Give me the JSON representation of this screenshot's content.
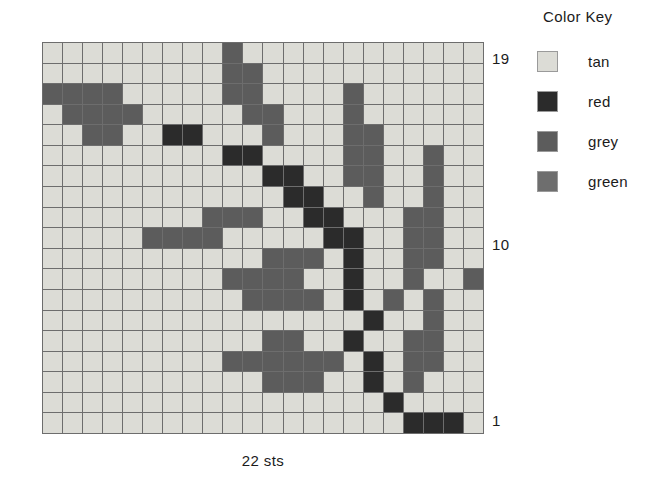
{
  "chart_data": {
    "type": "heatmap",
    "title": "",
    "xlabel": "22 sts",
    "ylabel": "",
    "columns": 22,
    "rows": 19,
    "grid_line_color": "#6d6d6d",
    "legend_position": "right",
    "palette": {
      "tan": "#dcdcd6",
      "red": "#2b2b2b",
      "grey": "#5c5c5c",
      "green": "#6e6e6e"
    },
    "row_labels": [
      "19",
      "10",
      "1"
    ],
    "note": "cells listed top row (19) first, left to right; values are color-key names",
    "cells": [
      [
        "tan",
        "tan",
        "tan",
        "tan",
        "tan",
        "tan",
        "tan",
        "tan",
        "tan",
        "grey",
        "tan",
        "tan",
        "tan",
        "tan",
        "tan",
        "tan",
        "tan",
        "tan",
        "tan",
        "tan",
        "tan",
        "tan"
      ],
      [
        "tan",
        "tan",
        "tan",
        "tan",
        "tan",
        "tan",
        "tan",
        "tan",
        "tan",
        "grey",
        "grey",
        "tan",
        "tan",
        "tan",
        "tan",
        "tan",
        "tan",
        "tan",
        "tan",
        "tan",
        "tan",
        "tan"
      ],
      [
        "grey",
        "grey",
        "grey",
        "grey",
        "tan",
        "tan",
        "tan",
        "tan",
        "tan",
        "grey",
        "grey",
        "tan",
        "tan",
        "tan",
        "tan",
        "grey",
        "tan",
        "tan",
        "tan",
        "tan",
        "tan",
        "tan"
      ],
      [
        "tan",
        "grey",
        "grey",
        "grey",
        "grey",
        "tan",
        "tan",
        "tan",
        "tan",
        "tan",
        "grey",
        "grey",
        "tan",
        "tan",
        "tan",
        "grey",
        "tan",
        "tan",
        "tan",
        "tan",
        "tan",
        "tan"
      ],
      [
        "tan",
        "tan",
        "grey",
        "grey",
        "tan",
        "tan",
        "red",
        "red",
        "tan",
        "tan",
        "tan",
        "grey",
        "tan",
        "tan",
        "tan",
        "grey",
        "grey",
        "tan",
        "tan",
        "tan",
        "tan",
        "tan"
      ],
      [
        "tan",
        "tan",
        "tan",
        "tan",
        "tan",
        "tan",
        "tan",
        "tan",
        "tan",
        "red",
        "red",
        "tan",
        "tan",
        "tan",
        "tan",
        "grey",
        "grey",
        "tan",
        "tan",
        "grey",
        "tan",
        "tan"
      ],
      [
        "tan",
        "tan",
        "tan",
        "tan",
        "tan",
        "tan",
        "tan",
        "tan",
        "tan",
        "tan",
        "tan",
        "red",
        "red",
        "tan",
        "tan",
        "grey",
        "grey",
        "tan",
        "tan",
        "grey",
        "tan",
        "tan"
      ],
      [
        "tan",
        "tan",
        "tan",
        "tan",
        "tan",
        "tan",
        "tan",
        "tan",
        "tan",
        "tan",
        "tan",
        "tan",
        "red",
        "red",
        "tan",
        "tan",
        "grey",
        "tan",
        "tan",
        "grey",
        "tan",
        "tan"
      ],
      [
        "tan",
        "tan",
        "tan",
        "tan",
        "tan",
        "tan",
        "tan",
        "tan",
        "grey",
        "grey",
        "grey",
        "tan",
        "tan",
        "red",
        "red",
        "tan",
        "tan",
        "tan",
        "grey",
        "grey",
        "tan",
        "tan"
      ],
      [
        "tan",
        "tan",
        "tan",
        "tan",
        "tan",
        "grey",
        "grey",
        "grey",
        "grey",
        "tan",
        "tan",
        "tan",
        "tan",
        "tan",
        "red",
        "red",
        "tan",
        "tan",
        "grey",
        "grey",
        "tan",
        "tan"
      ],
      [
        "tan",
        "tan",
        "tan",
        "tan",
        "tan",
        "tan",
        "tan",
        "tan",
        "tan",
        "tan",
        "tan",
        "grey",
        "grey",
        "grey",
        "tan",
        "red",
        "tan",
        "tan",
        "grey",
        "grey",
        "tan",
        "tan"
      ],
      [
        "tan",
        "tan",
        "tan",
        "tan",
        "tan",
        "tan",
        "tan",
        "tan",
        "tan",
        "grey",
        "grey",
        "grey",
        "grey",
        "tan",
        "tan",
        "red",
        "tan",
        "tan",
        "grey",
        "tan",
        "tan",
        "grey"
      ],
      [
        "tan",
        "tan",
        "tan",
        "tan",
        "tan",
        "tan",
        "tan",
        "tan",
        "tan",
        "tan",
        "grey",
        "grey",
        "grey",
        "grey",
        "tan",
        "red",
        "tan",
        "grey",
        "tan",
        "grey",
        "tan",
        "tan"
      ],
      [
        "tan",
        "tan",
        "tan",
        "tan",
        "tan",
        "tan",
        "tan",
        "tan",
        "tan",
        "tan",
        "tan",
        "tan",
        "tan",
        "tan",
        "tan",
        "tan",
        "red",
        "tan",
        "tan",
        "grey",
        "tan",
        "tan"
      ],
      [
        "tan",
        "tan",
        "tan",
        "tan",
        "tan",
        "tan",
        "tan",
        "tan",
        "tan",
        "tan",
        "tan",
        "grey",
        "grey",
        "tan",
        "tan",
        "red",
        "tan",
        "tan",
        "grey",
        "grey",
        "tan",
        "tan"
      ],
      [
        "tan",
        "tan",
        "tan",
        "tan",
        "tan",
        "tan",
        "tan",
        "tan",
        "tan",
        "grey",
        "grey",
        "grey",
        "grey",
        "grey",
        "grey",
        "tan",
        "red",
        "tan",
        "grey",
        "grey",
        "tan",
        "tan"
      ],
      [
        "tan",
        "tan",
        "tan",
        "tan",
        "tan",
        "tan",
        "tan",
        "tan",
        "tan",
        "tan",
        "tan",
        "grey",
        "grey",
        "grey",
        "tan",
        "tan",
        "red",
        "tan",
        "grey",
        "tan",
        "tan",
        "tan"
      ],
      [
        "tan",
        "tan",
        "tan",
        "tan",
        "tan",
        "tan",
        "tan",
        "tan",
        "tan",
        "tan",
        "tan",
        "tan",
        "tan",
        "tan",
        "tan",
        "tan",
        "tan",
        "red",
        "tan",
        "tan",
        "tan",
        "tan"
      ],
      [
        "tan",
        "tan",
        "tan",
        "tan",
        "tan",
        "tan",
        "tan",
        "tan",
        "tan",
        "tan",
        "tan",
        "tan",
        "tan",
        "tan",
        "tan",
        "tan",
        "tan",
        "tan",
        "red",
        "red",
        "red",
        "tan"
      ]
    ]
  },
  "row_labels": {
    "top": "19",
    "middle": "10",
    "bottom": "1"
  },
  "caption": {
    "sts": "22 sts"
  },
  "color_key": {
    "title": "Color Key",
    "entries": [
      {
        "label": "tan",
        "color": "#dcdcd6"
      },
      {
        "label": "red",
        "color": "#2b2b2b"
      },
      {
        "label": "grey",
        "color": "#5c5c5c"
      },
      {
        "label": "green",
        "color": "#6e6e6e"
      }
    ]
  }
}
